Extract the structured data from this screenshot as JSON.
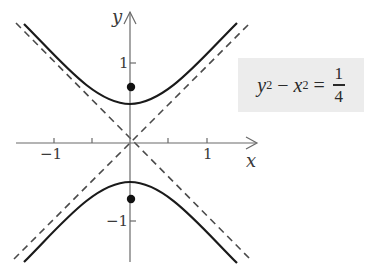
{
  "diagram": {
    "type": "hyperbola",
    "equation": {
      "lhs_term1_var": "y",
      "lhs_term1_exp": "2",
      "minus": "−",
      "lhs_term2_var": "x",
      "lhs_term2_exp": "2",
      "equals": "=",
      "rhs_numerator": "1",
      "rhs_denominator": "4"
    },
    "axes": {
      "x_label": "x",
      "y_label": "y",
      "x_ticks": [
        {
          "value": -1,
          "label": "−1"
        },
        {
          "value": -0.5,
          "label": ""
        },
        {
          "value": 0.5,
          "label": ""
        },
        {
          "value": 1,
          "label": "1"
        }
      ],
      "y_ticks": [
        {
          "value": 1,
          "label": "1"
        },
        {
          "value": -1,
          "label": "−1"
        }
      ]
    },
    "asymptotes": [
      "y = x",
      "y = −x"
    ],
    "vertices": [
      [
        0,
        0.5
      ],
      [
        0,
        -0.5
      ]
    ],
    "foci": [
      [
        0,
        0.7071
      ],
      [
        0,
        -0.7071
      ]
    ],
    "colors": {
      "curve": "#1a1a1a",
      "asymptote": "#4a4a4a",
      "axis": "#6a6a6a",
      "focus": "#111111",
      "equation_box": "#ececec"
    }
  }
}
